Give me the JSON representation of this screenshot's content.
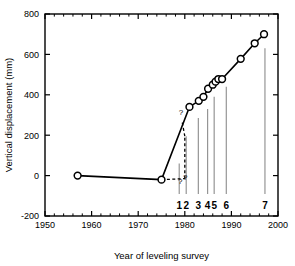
{
  "chart_data": {
    "type": "line",
    "title": "",
    "xlabel": "Year of leveling survey",
    "ylabel": "Vertical displacement (mm)",
    "xlim": [
      1950,
      2000
    ],
    "ylim": [
      -200,
      800
    ],
    "xticks": [
      1950,
      1960,
      1970,
      1980,
      1990,
      2000
    ],
    "xtick_labels": [
      "1950",
      "1960",
      "1970",
      "1980",
      "1990",
      "2000"
    ],
    "yticks": [
      -200,
      0,
      200,
      400,
      600,
      800
    ],
    "ytick_labels": [
      "-200",
      "0",
      "200",
      "400",
      "600",
      "800"
    ],
    "x_minor_tick_interval": 2,
    "y_minor_tick_interval": 50,
    "grid": false,
    "legend": null,
    "series": [
      {
        "name": "Vertical displacement",
        "marker": "open-circle",
        "line_style": "solid",
        "x": [
          1957,
          1975,
          1981,
          1983,
          1984,
          1985,
          1986,
          1986.6,
          1987.2,
          1988,
          1992,
          1995,
          1997
        ],
        "y": [
          0,
          -20,
          340,
          370,
          390,
          430,
          450,
          465,
          478,
          478,
          578,
          655,
          700
        ]
      }
    ],
    "annotations": [
      {
        "text": "?",
        "x": 1979.2,
        "y": 300,
        "name": "question-mark-upper"
      },
      {
        "text": "?",
        "x": 1979.0,
        "y": -40,
        "name": "question-mark-lower-left"
      },
      {
        "text": "?",
        "x": 1980.1,
        "y": -20,
        "name": "question-mark-lower-right"
      }
    ],
    "dashed_segments": [
      {
        "name": "dashed-horizontal-1975",
        "x": [
          1975,
          1980
        ],
        "y": [
          -20,
          -15
        ]
      },
      {
        "name": "dashed-vertical-1980",
        "x": [
          1980,
          1980
        ],
        "y": [
          -15,
          195
        ]
      },
      {
        "name": "dashed-upper-tick",
        "x": [
          1980,
          1979.4
        ],
        "y": [
          195,
          270
        ]
      }
    ],
    "event_markers": [
      {
        "label": "1",
        "year": 1978.8,
        "top_value": 60
      },
      {
        "label": "2",
        "year": 1980.3,
        "top_value": 195
      },
      {
        "label": "3",
        "year": 1982.9,
        "top_value": 285
      },
      {
        "label": "4",
        "year": 1984.9,
        "top_value": 330
      },
      {
        "label": "5",
        "year": 1986.3,
        "top_value": 390
      },
      {
        "label": "6",
        "year": 1988.9,
        "top_value": 440
      },
      {
        "label": "7",
        "year": 1997.2,
        "top_value": 630
      }
    ],
    "colors": {
      "line": "#000000",
      "marker_face": "#ffffff",
      "marker_edge": "#000000",
      "axis": "#000000",
      "event_marker_line": "#8c8c8c",
      "background": "#ffffff"
    }
  }
}
